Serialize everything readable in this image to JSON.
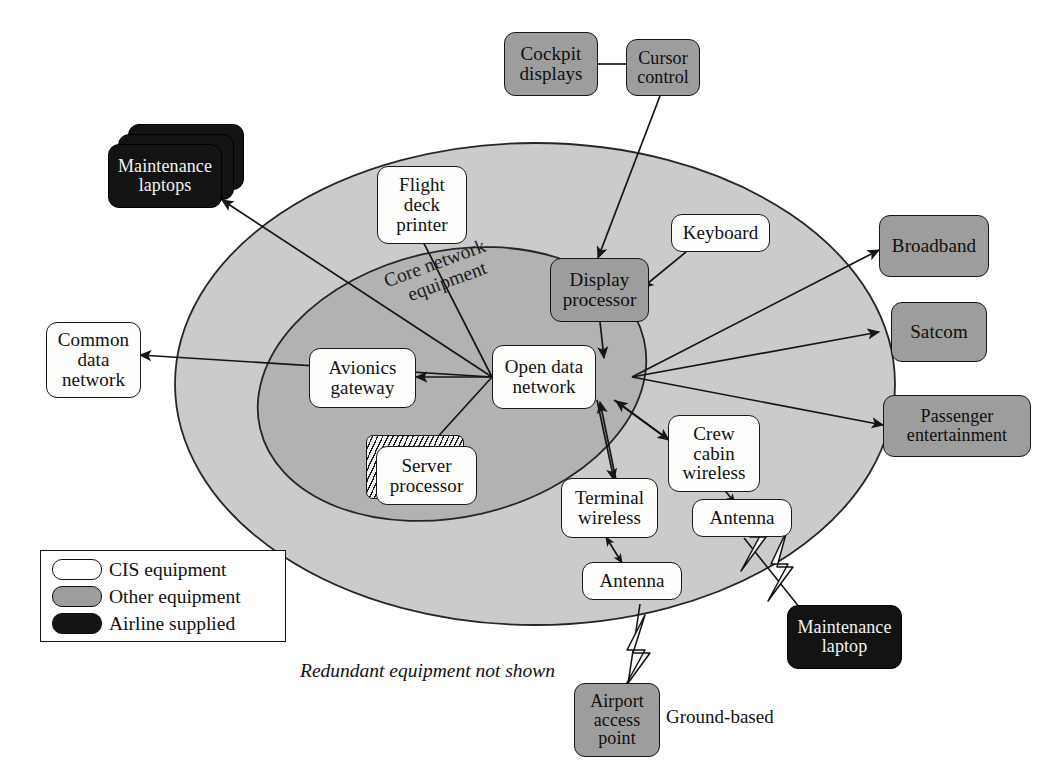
{
  "diagram": {
    "footnote": "Redundant equipment not shown",
    "ground_label": "Ground-based",
    "zone_labels": {
      "core": "Core network",
      "core2": "equipment"
    },
    "colors": {
      "cis_equipment": "#fdfdfb",
      "other_equipment": "#9d9d9d",
      "airline_supplied": "#131313",
      "outer_zone": "#cccccc",
      "inner_zone": "#b4b4b4",
      "line": "#1a1a1a"
    }
  },
  "legend": {
    "items": [
      {
        "label": "CIS equipment",
        "kind": "cis"
      },
      {
        "label": "Other equipment",
        "kind": "other"
      },
      {
        "label": "Airline supplied",
        "kind": "airline"
      }
    ]
  },
  "nodes": {
    "cockpit_displays": {
      "label": "Cockpit displays",
      "line1": "Cockpit",
      "line2": "displays",
      "kind": "other"
    },
    "cursor_control": {
      "label": "Cursor control",
      "line1": "Cursor",
      "line2": "control",
      "kind": "other"
    },
    "maintenance_laptops": {
      "label": "Maintenance laptops",
      "line1": "Maintenance",
      "line2": "laptops",
      "kind": "airline"
    },
    "flight_deck_printer": {
      "label": "Flight deck printer",
      "line1": "Flight",
      "line2": "deck",
      "line3": "printer",
      "kind": "cis"
    },
    "keyboard": {
      "label": "Keyboard",
      "line1": "Keyboard",
      "kind": "cis"
    },
    "display_processor": {
      "label": "Display processor",
      "line1": "Display",
      "line2": "processor",
      "kind": "other"
    },
    "broadband": {
      "label": "Broadband",
      "line1": "Broadband",
      "kind": "other"
    },
    "satcom": {
      "label": "Satcom",
      "line1": "Satcom",
      "kind": "other"
    },
    "passenger_entertainment": {
      "label": "Passenger entertainment",
      "line1": "Passenger",
      "line2": "entertainment",
      "kind": "other"
    },
    "common_data_network": {
      "label": "Common data network",
      "line1": "Common",
      "line2": "data",
      "line3": "network",
      "kind": "cis"
    },
    "avionics_gateway": {
      "label": "Avionics gateway",
      "line1": "Avionics",
      "line2": "gateway",
      "kind": "cis"
    },
    "open_data_network": {
      "label": "Open data network",
      "line1": "Open data",
      "line2": "network",
      "kind": "cis"
    },
    "server_processor": {
      "label": "Server processor",
      "line1": "Server",
      "line2": "processor",
      "kind": "cis"
    },
    "crew_cabin_wireless": {
      "label": "Crew cabin wireless",
      "line1": "Crew",
      "line2": "cabin",
      "line3": "wireless",
      "kind": "cis"
    },
    "terminal_wireless": {
      "label": "Terminal wireless",
      "line1": "Terminal",
      "line2": "wireless",
      "kind": "cis"
    },
    "antenna_crew": {
      "label": "Antenna",
      "line1": "Antenna",
      "kind": "cis"
    },
    "antenna_terminal": {
      "label": "Antenna",
      "line1": "Antenna",
      "kind": "cis"
    },
    "maintenance_laptop": {
      "label": "Maintenance laptop",
      "line1": "Maintenance",
      "line2": "laptop",
      "kind": "airline"
    },
    "airport_access_point": {
      "label": "Airport access point",
      "line1": "Airport",
      "line2": "access",
      "line3": "point",
      "kind": "other"
    }
  },
  "connections": [
    {
      "from": "cockpit_displays",
      "to": "cursor_control",
      "style": "plain"
    },
    {
      "from": "cursor_control",
      "to": "display_processor",
      "style": "arrow"
    },
    {
      "from": "keyboard",
      "to": "display_processor",
      "style": "arrow"
    },
    {
      "from": "display_processor",
      "to": "open_data_network",
      "style": "arrow"
    },
    {
      "from": "open_data_network",
      "to": "maintenance_laptops",
      "style": "arrow"
    },
    {
      "from": "open_data_network",
      "to": "flight_deck_printer",
      "style": "arrow"
    },
    {
      "from": "open_data_network",
      "to": "common_data_network",
      "style": "arrow"
    },
    {
      "from": "open_data_network",
      "to": "avionics_gateway",
      "style": "arrow"
    },
    {
      "from": "open_data_network",
      "to": "server_processor",
      "style": "plain"
    },
    {
      "from": "open_data_network",
      "to": "broadband",
      "style": "arrow"
    },
    {
      "from": "open_data_network",
      "to": "satcom",
      "style": "arrow"
    },
    {
      "from": "open_data_network",
      "to": "passenger_entertainment",
      "style": "arrow"
    },
    {
      "from": "open_data_network",
      "to": "crew_cabin_wireless",
      "style": "arrow"
    },
    {
      "from": "open_data_network",
      "to": "terminal_wireless",
      "style": "arrow"
    },
    {
      "from": "crew_cabin_wireless",
      "to": "antenna_crew",
      "style": "double"
    },
    {
      "from": "terminal_wireless",
      "to": "antenna_terminal",
      "style": "double"
    },
    {
      "from": "antenna_crew",
      "to": "maintenance_laptop",
      "style": "wireless"
    },
    {
      "from": "antenna_terminal",
      "to": "airport_access_point",
      "style": "wireless"
    }
  ]
}
